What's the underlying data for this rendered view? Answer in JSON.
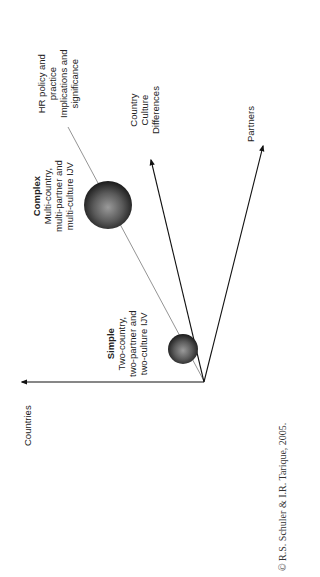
{
  "diagram": {
    "axes": {
      "countries": "Countries",
      "culture": [
        "Country",
        "Culture",
        "Differences"
      ],
      "partners": "Partners"
    },
    "hr_label": [
      "HR policy and",
      "practice",
      "Implications and",
      "significance"
    ],
    "simple": {
      "title": "Simple",
      "lines": [
        "Two-country,",
        "two-partner and",
        "two-culture IJV"
      ]
    },
    "complex": {
      "title": "Complex",
      "lines": [
        "Multi-country,",
        "multi-partner and",
        "multi-culture IJV"
      ]
    },
    "copyright": "© R.S. Schuler & I.R. Tarique, 2005."
  }
}
